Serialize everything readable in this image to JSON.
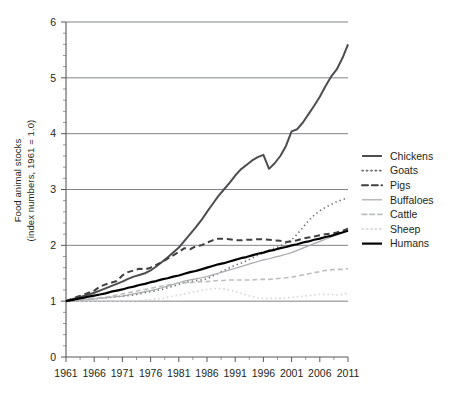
{
  "chart_data": {
    "type": "line",
    "title": "",
    "xlabel": "",
    "ylabel_line1": "Food animal stocks",
    "ylabel_line2": "(index numbers, 1961 = 1.0)",
    "xlim": [
      1961,
      2011
    ],
    "ylim": [
      0,
      6
    ],
    "yticks": [
      0,
      1,
      2,
      3,
      4,
      5,
      6
    ],
    "ytick_labels": [
      "0",
      "1",
      "2",
      "3",
      "4",
      "5",
      "6"
    ],
    "xticks": [
      1961,
      1966,
      1971,
      1976,
      1981,
      1986,
      1991,
      1996,
      2001,
      2006,
      2011
    ],
    "xtick_labels": [
      "1961",
      "1966",
      "1971",
      "1976",
      "1981",
      "1986",
      "1991",
      "1996",
      "2001",
      "2006",
      "2011"
    ],
    "grid": "horizontal",
    "legend_position": "right",
    "x": [
      1961,
      1962,
      1963,
      1964,
      1965,
      1966,
      1967,
      1968,
      1969,
      1970,
      1971,
      1972,
      1973,
      1974,
      1975,
      1976,
      1977,
      1978,
      1979,
      1980,
      1981,
      1982,
      1983,
      1984,
      1985,
      1986,
      1987,
      1988,
      1989,
      1990,
      1991,
      1992,
      1993,
      1994,
      1995,
      1996,
      1997,
      1998,
      1999,
      2000,
      2001,
      2002,
      2003,
      2004,
      2005,
      2006,
      2007,
      2008,
      2009,
      2010,
      2011
    ],
    "series": [
      {
        "name": "Chickens",
        "color": "#4d4d4f",
        "style": "solid",
        "width": 2.0,
        "values": [
          1.0,
          1.03,
          1.06,
          1.09,
          1.12,
          1.15,
          1.19,
          1.23,
          1.27,
          1.31,
          1.35,
          1.4,
          1.44,
          1.47,
          1.5,
          1.55,
          1.62,
          1.7,
          1.78,
          1.87,
          1.96,
          2.08,
          2.2,
          2.32,
          2.45,
          2.6,
          2.74,
          2.88,
          3.0,
          3.12,
          3.25,
          3.36,
          3.44,
          3.52,
          3.58,
          3.62,
          3.37,
          3.47,
          3.6,
          3.78,
          4.04,
          4.08,
          4.2,
          4.35,
          4.5,
          4.66,
          4.85,
          5.02,
          5.15,
          5.35,
          5.6
        ]
      },
      {
        "name": "Goats",
        "color": "#6d6e71",
        "style": "dotted",
        "width": 1.6,
        "values": [
          1.0,
          1.005,
          1.01,
          1.02,
          1.03,
          1.04,
          1.05,
          1.06,
          1.07,
          1.08,
          1.09,
          1.1,
          1.11,
          1.13,
          1.15,
          1.17,
          1.19,
          1.21,
          1.24,
          1.27,
          1.3,
          1.33,
          1.35,
          1.37,
          1.38,
          1.4,
          1.45,
          1.5,
          1.55,
          1.6,
          1.64,
          1.68,
          1.72,
          1.77,
          1.82,
          1.87,
          1.91,
          1.95,
          1.99,
          2.04,
          2.1,
          2.2,
          2.32,
          2.44,
          2.54,
          2.62,
          2.68,
          2.73,
          2.78,
          2.82,
          2.85
        ]
      },
      {
        "name": "Pigs",
        "color": "#404041",
        "style": "dashed",
        "width": 2.0,
        "values": [
          1.0,
          1.04,
          1.08,
          1.11,
          1.15,
          1.19,
          1.26,
          1.3,
          1.33,
          1.36,
          1.46,
          1.52,
          1.55,
          1.58,
          1.57,
          1.6,
          1.65,
          1.7,
          1.76,
          1.82,
          1.88,
          1.95,
          1.93,
          1.98,
          2.0,
          2.05,
          2.09,
          2.12,
          2.12,
          2.11,
          2.09,
          2.09,
          2.1,
          2.1,
          2.11,
          2.11,
          2.1,
          2.09,
          2.08,
          2.06,
          2.07,
          2.09,
          2.12,
          2.14,
          2.16,
          2.18,
          2.2,
          2.21,
          2.23,
          2.26,
          2.3
        ]
      },
      {
        "name": "Buffaloes",
        "color": "#a7a9ac",
        "style": "solid",
        "width": 1.2,
        "values": [
          1.0,
          1.005,
          1.01,
          1.02,
          1.03,
          1.04,
          1.05,
          1.06,
          1.07,
          1.08,
          1.09,
          1.11,
          1.13,
          1.15,
          1.17,
          1.19,
          1.21,
          1.24,
          1.27,
          1.3,
          1.33,
          1.36,
          1.38,
          1.4,
          1.42,
          1.44,
          1.47,
          1.5,
          1.53,
          1.56,
          1.59,
          1.62,
          1.65,
          1.68,
          1.71,
          1.74,
          1.76,
          1.79,
          1.81,
          1.84,
          1.87,
          1.91,
          1.95,
          1.99,
          2.03,
          2.07,
          2.11,
          2.15,
          2.19,
          2.23,
          2.27
        ]
      },
      {
        "name": "Cattle",
        "color": "#bcbec0",
        "style": "dashed",
        "width": 1.6,
        "values": [
          1.0,
          1.01,
          1.02,
          1.03,
          1.04,
          1.05,
          1.06,
          1.07,
          1.09,
          1.11,
          1.13,
          1.15,
          1.17,
          1.19,
          1.21,
          1.23,
          1.25,
          1.27,
          1.29,
          1.31,
          1.32,
          1.33,
          1.33,
          1.34,
          1.35,
          1.35,
          1.36,
          1.37,
          1.37,
          1.38,
          1.38,
          1.38,
          1.38,
          1.38,
          1.39,
          1.39,
          1.39,
          1.4,
          1.41,
          1.42,
          1.43,
          1.45,
          1.47,
          1.49,
          1.51,
          1.53,
          1.55,
          1.56,
          1.57,
          1.57,
          1.58
        ]
      },
      {
        "name": "Sheep",
        "color": "#d1d3d4",
        "style": "dotted",
        "width": 1.6,
        "values": [
          1.0,
          1.0,
          1.0,
          1.0,
          1.0,
          1.0,
          1.0,
          1.0,
          1.0,
          1.0,
          1.0,
          1.0,
          1.0,
          1.01,
          1.02,
          1.03,
          1.04,
          1.05,
          1.07,
          1.09,
          1.11,
          1.13,
          1.15,
          1.17,
          1.19,
          1.21,
          1.22,
          1.23,
          1.22,
          1.2,
          1.17,
          1.14,
          1.11,
          1.08,
          1.06,
          1.05,
          1.05,
          1.05,
          1.05,
          1.06,
          1.07,
          1.08,
          1.09,
          1.1,
          1.11,
          1.12,
          1.12,
          1.12,
          1.11,
          1.12,
          1.15
        ]
      },
      {
        "name": "Humans",
        "color": "#000000",
        "style": "solid",
        "width": 2.2,
        "values": [
          1.0,
          1.02,
          1.04,
          1.06,
          1.08,
          1.1,
          1.12,
          1.14,
          1.17,
          1.19,
          1.21,
          1.24,
          1.26,
          1.29,
          1.31,
          1.34,
          1.36,
          1.39,
          1.41,
          1.44,
          1.46,
          1.49,
          1.52,
          1.54,
          1.57,
          1.6,
          1.63,
          1.66,
          1.68,
          1.71,
          1.74,
          1.77,
          1.79,
          1.82,
          1.85,
          1.87,
          1.9,
          1.92,
          1.95,
          1.97,
          2.0,
          2.02,
          2.05,
          2.07,
          2.1,
          2.12,
          2.15,
          2.17,
          2.2,
          2.23,
          2.26
        ]
      }
    ]
  },
  "legend": {
    "items": [
      {
        "label": "Chickens"
      },
      {
        "label": "Goats"
      },
      {
        "label": "Pigs"
      },
      {
        "label": "Buffaloes"
      },
      {
        "label": "Cattle"
      },
      {
        "label": "Sheep"
      },
      {
        "label": "Humans"
      }
    ]
  }
}
